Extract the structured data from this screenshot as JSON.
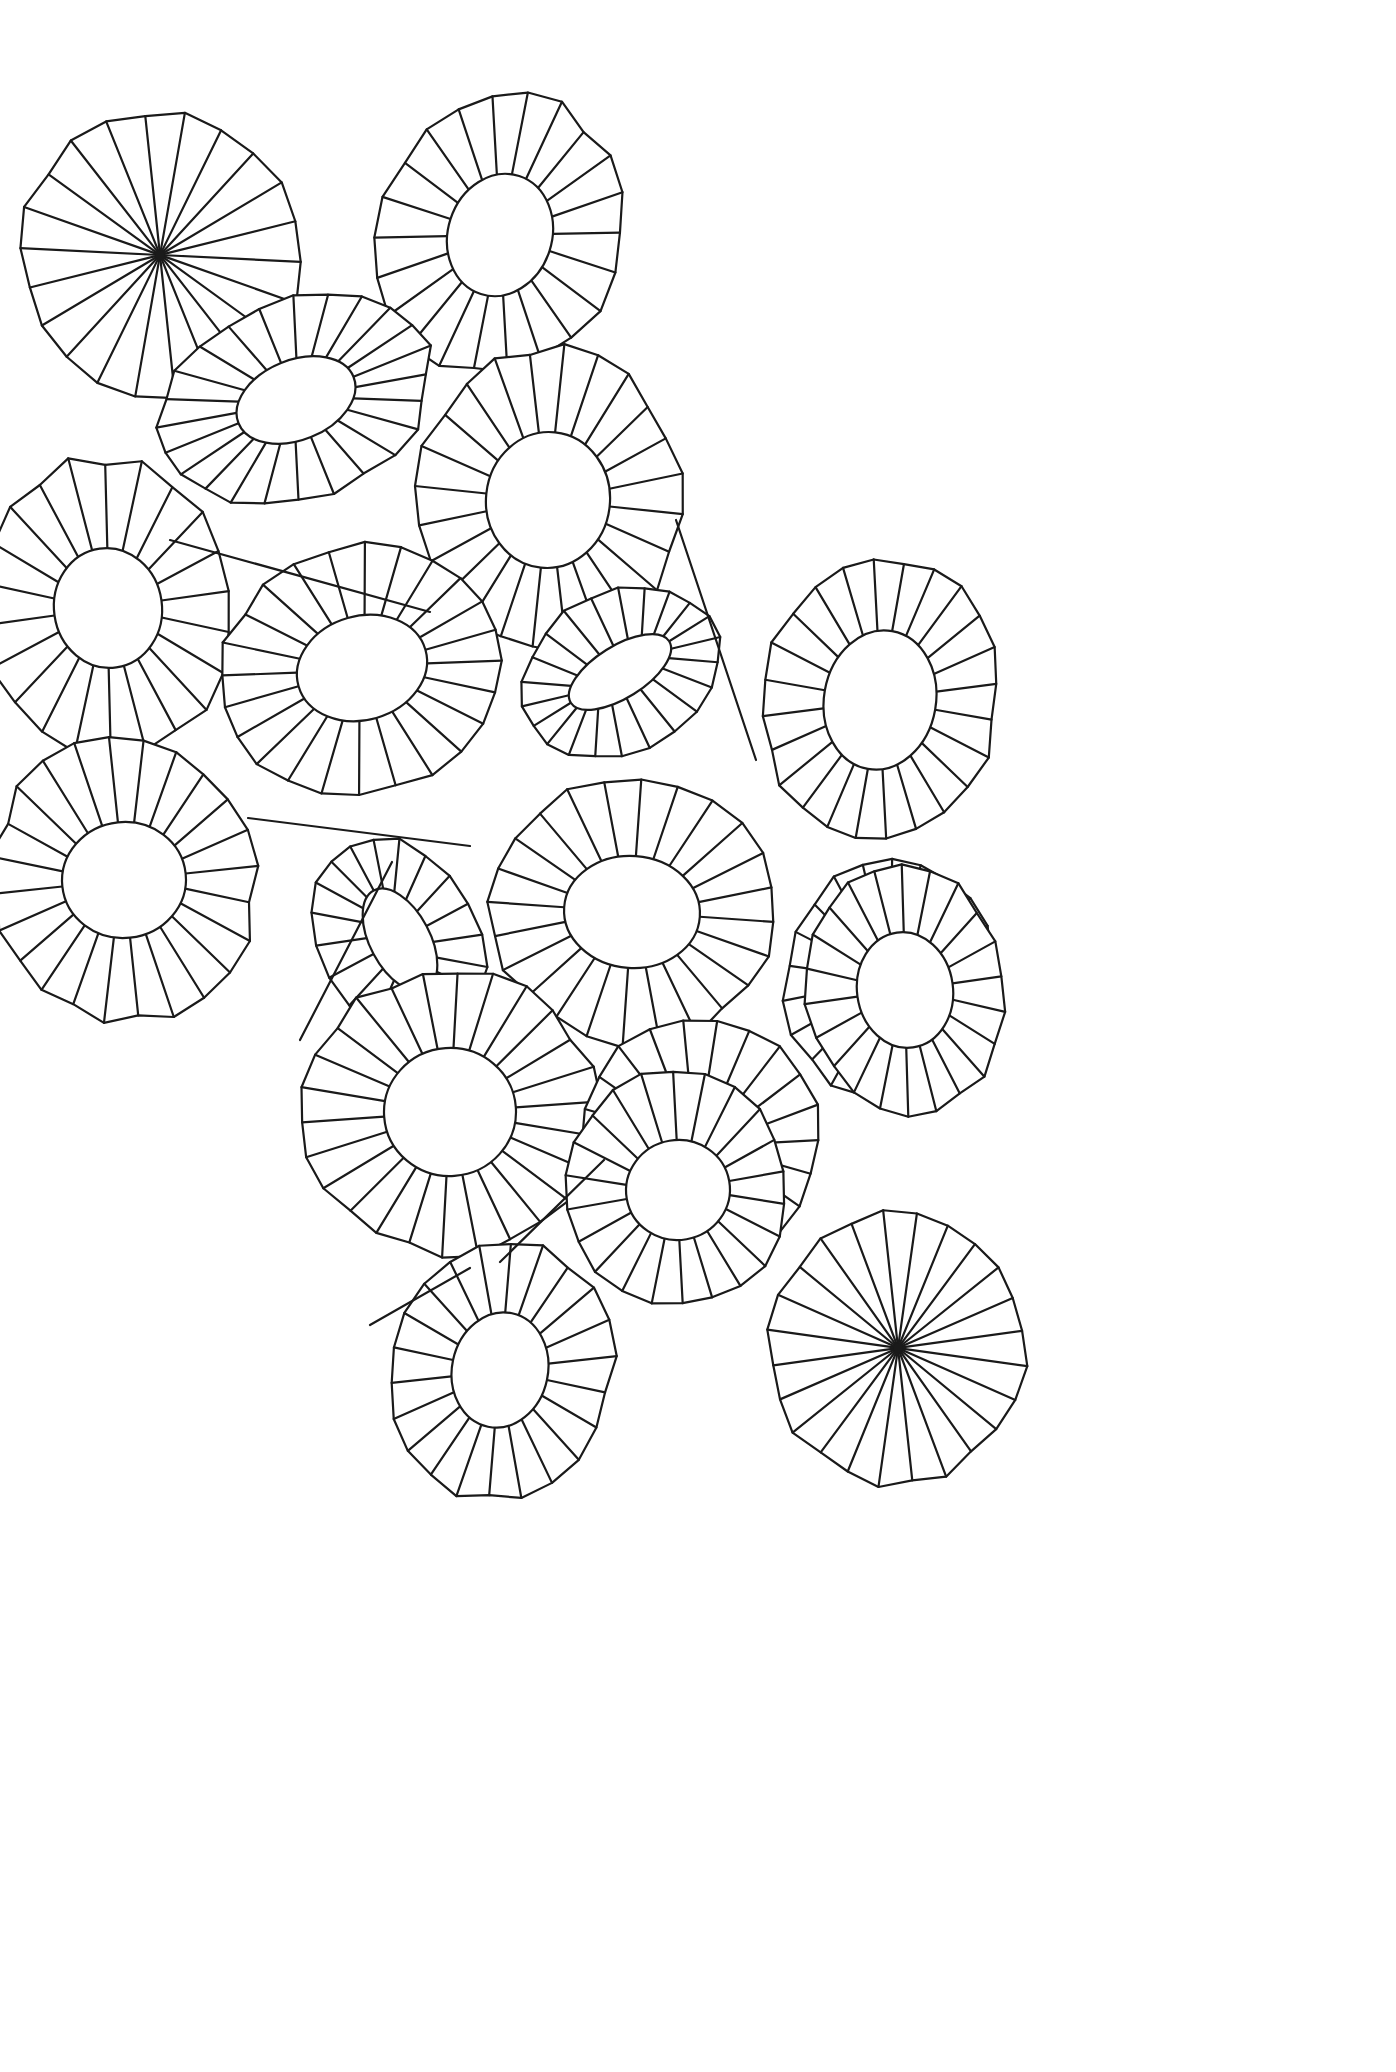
{
  "artwork": {
    "title": "Overlapping Rosette Sunburst Line Drawing",
    "medium": "black line art on white",
    "canvas": {
      "width": 1396,
      "height": 2072
    },
    "style": {
      "background_color": "#ffffff",
      "stroke_color": "#1a1a1a",
      "stroke_width": 2.2,
      "fill": "none"
    },
    "description": "A flat field of about eighteen overlapping radial rosette forms resembling lily pads or folded paper parasols seen at varying tilts. Each rosette is an outer many-sided polygon rim, an inner ellipse opening, and straight radial spokes joining rim to opening. Two rosettes have the inner opening collapsed to a single point so all spokes converge to a dark node."
  },
  "shapes": [
    {
      "id": 1,
      "name": "rosette-top-left-converging",
      "center": [
        160,
        255
      ],
      "outer_radius_x": 138,
      "outer_radius_y": 142,
      "inner_radius_x": 1,
      "inner_radius_y": 1,
      "rotation_deg": -14,
      "spokes": 22,
      "hub": "point",
      "z": 1
    },
    {
      "id": 2,
      "name": "rosette-top-center",
      "center": [
        500,
        235
      ],
      "outer_radius_x": 120,
      "outer_radius_y": 142,
      "inner_radius_x": 52,
      "inner_radius_y": 62,
      "rotation_deg": 18,
      "spokes": 22,
      "hub": "ellipse",
      "z": 2
    },
    {
      "id": 3,
      "name": "rosette-upper-left-tilted",
      "center": [
        296,
        400
      ],
      "outer_radius_x": 140,
      "outer_radius_y": 100,
      "inner_radius_x": 62,
      "inner_radius_y": 40,
      "rotation_deg": -22,
      "spokes": 24,
      "hub": "ellipse",
      "z": 3
    },
    {
      "id": 4,
      "name": "rosette-upper-mid-large",
      "center": [
        548,
        500
      ],
      "outer_radius_x": 132,
      "outer_radius_y": 152,
      "inner_radius_x": 62,
      "inner_radius_y": 68,
      "rotation_deg": 6,
      "spokes": 24,
      "hub": "ellipse",
      "z": 4
    },
    {
      "id": 5,
      "name": "rosette-left-edge",
      "center": [
        108,
        608
      ],
      "outer_radius_x": 126,
      "outer_radius_y": 150,
      "inner_radius_x": 54,
      "inner_radius_y": 60,
      "rotation_deg": -8,
      "spokes": 22,
      "hub": "ellipse",
      "z": 5
    },
    {
      "id": 6,
      "name": "rosette-mid-left",
      "center": [
        362,
        668
      ],
      "outer_radius_x": 142,
      "outer_radius_y": 122,
      "inner_radius_x": 66,
      "inner_radius_y": 52,
      "rotation_deg": -16,
      "spokes": 24,
      "hub": "ellipse",
      "z": 6
    },
    {
      "id": 7,
      "name": "rosette-mid-small-oblique",
      "center": [
        620,
        672
      ],
      "outer_radius_x": 104,
      "outer_radius_y": 80,
      "inner_radius_x": 58,
      "inner_radius_y": 26,
      "rotation_deg": -32,
      "spokes": 22,
      "hub": "ellipse",
      "z": 7
    },
    {
      "id": 8,
      "name": "rosette-right-upper",
      "center": [
        880,
        700
      ],
      "outer_radius_x": 118,
      "outer_radius_y": 142,
      "inner_radius_x": 56,
      "inner_radius_y": 70,
      "rotation_deg": 10,
      "spokes": 24,
      "hub": "ellipse",
      "z": 8
    },
    {
      "id": 9,
      "name": "rosette-left-lower",
      "center": [
        124,
        880
      ],
      "outer_radius_x": 132,
      "outer_radius_y": 142,
      "inner_radius_x": 62,
      "inner_radius_y": 58,
      "rotation_deg": -6,
      "spokes": 24,
      "hub": "ellipse",
      "z": 9
    },
    {
      "id": 10,
      "name": "rosette-center-mid",
      "center": [
        632,
        912
      ],
      "outer_radius_x": 142,
      "outer_radius_y": 132,
      "inner_radius_x": 68,
      "inner_radius_y": 56,
      "rotation_deg": 4,
      "spokes": 24,
      "hub": "ellipse",
      "z": 10
    },
    {
      "id": 11,
      "name": "rosette-small-oblique-left-of-center",
      "center": [
        400,
        940
      ],
      "outer_radius_x": 78,
      "outer_radius_y": 108,
      "inner_radius_x": 30,
      "inner_radius_y": 56,
      "rotation_deg": -28,
      "spokes": 20,
      "hub": "ellipse",
      "z": 11
    },
    {
      "id": 12,
      "name": "rosette-right-lower",
      "center": [
        890,
        980
      ],
      "outer_radius_x": 104,
      "outer_radius_y": 122,
      "inner_radius_x": 50,
      "inner_radius_y": 58,
      "rotation_deg": 8,
      "spokes": 22,
      "hub": "ellipse",
      "z": 12
    },
    {
      "id": 13,
      "name": "rosette-bottom-center-large",
      "center": [
        450,
        1112
      ],
      "outer_radius_x": 146,
      "outer_radius_y": 142,
      "inner_radius_x": 66,
      "inner_radius_y": 64,
      "rotation_deg": -4,
      "spokes": 26,
      "hub": "ellipse",
      "z": 13
    },
    {
      "id": 14,
      "name": "rosette-bottom-right-mid",
      "center": [
        700,
        1142
      ],
      "outer_radius_x": 120,
      "outer_radius_y": 124,
      "inner_radius_x": 58,
      "inner_radius_y": 52,
      "rotation_deg": 16,
      "spokes": 22,
      "hub": "ellipse",
      "z": 14
    },
    {
      "id": 15,
      "name": "rosette-far-right-lower",
      "center": [
        905,
        990
      ],
      "outer_radius_x": 100,
      "outer_radius_y": 126,
      "inner_radius_x": 48,
      "inner_radius_y": 58,
      "rotation_deg": -8,
      "spokes": 22,
      "hub": "ellipse",
      "z": 15
    },
    {
      "id": 16,
      "name": "rosette-bottom-left-lower",
      "center": [
        500,
        1370
      ],
      "outer_radius_x": 112,
      "outer_radius_y": 130,
      "inner_radius_x": 48,
      "inner_radius_y": 58,
      "rotation_deg": 12,
      "spokes": 22,
      "hub": "ellipse",
      "z": 16
    },
    {
      "id": 17,
      "name": "rosette-bottom-right-converging",
      "center": [
        898,
        1348
      ],
      "outer_radius_x": 128,
      "outer_radius_y": 136,
      "inner_radius_x": 1,
      "inner_radius_y": 1,
      "rotation_deg": 8,
      "spokes": 24,
      "hub": "point",
      "z": 17
    },
    {
      "id": 18,
      "name": "rosette-bottom-mid-right",
      "center": [
        678,
        1190
      ],
      "outer_radius_x": 110,
      "outer_radius_y": 118,
      "inner_radius_x": 52,
      "inner_radius_y": 50,
      "rotation_deg": -10,
      "spokes": 22,
      "hub": "ellipse",
      "z": 18
    }
  ],
  "connector_lines": [
    {
      "name": "connector-upper-left",
      "x1": 170,
      "y1": 540,
      "x2": 430,
      "y2": 612
    },
    {
      "name": "connector-mid-right",
      "x1": 676,
      "y1": 520,
      "x2": 756,
      "y2": 760
    },
    {
      "name": "connector-left-band",
      "x1": 248,
      "y1": 818,
      "x2": 470,
      "y2": 846
    },
    {
      "name": "connector-center-fan",
      "x1": 300,
      "y1": 1040,
      "x2": 392,
      "y2": 862
    },
    {
      "name": "connector-bottom-wedge",
      "x1": 500,
      "y1": 1262,
      "x2": 604,
      "y2": 1160
    },
    {
      "name": "connector-bottom-left-wedge",
      "x1": 370,
      "y1": 1325,
      "x2": 470,
      "y2": 1268
    }
  ]
}
